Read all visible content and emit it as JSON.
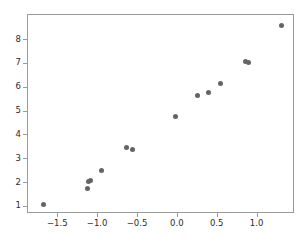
{
  "chart_data": {
    "type": "scatter",
    "title": "",
    "xlabel": "",
    "ylabel": "",
    "grid": false,
    "legend": null,
    "marker_color": "#646464",
    "axes_color": "#9a9a9a",
    "background": "#ffffff",
    "xlim": [
      -1.88,
      1.47
    ],
    "ylim": [
      0.7,
      9.05
    ],
    "xticks": [
      -1.5,
      -1.0,
      -0.5,
      0.0,
      0.5,
      1.0
    ],
    "xticklabels": [
      "−1.5",
      "−1.0",
      "−0.5",
      "0.0",
      "0.5",
      "1.0"
    ],
    "yticks": [
      1,
      2,
      3,
      4,
      5,
      6,
      7,
      8
    ],
    "yticklabels": [
      "1",
      "2",
      "3",
      "4",
      "5",
      "6",
      "7",
      "8"
    ],
    "points": [
      {
        "x": -1.68,
        "y": 1.09
      },
      {
        "x": -1.13,
        "y": 1.75
      },
      {
        "x": -1.12,
        "y": 2.05
      },
      {
        "x": -1.09,
        "y": 2.09
      },
      {
        "x": -0.96,
        "y": 2.51
      },
      {
        "x": -0.64,
        "y": 3.47
      },
      {
        "x": -0.57,
        "y": 3.39
      },
      {
        "x": -0.03,
        "y": 4.79
      },
      {
        "x": 0.25,
        "y": 5.66
      },
      {
        "x": 0.38,
        "y": 5.8
      },
      {
        "x": 0.53,
        "y": 6.19
      },
      {
        "x": 0.85,
        "y": 7.09
      },
      {
        "x": 0.89,
        "y": 7.05
      },
      {
        "x": 1.3,
        "y": 8.62
      }
    ]
  }
}
